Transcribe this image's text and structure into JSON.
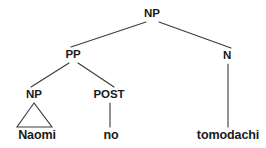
{
  "figure": {
    "kind": "syntax-tree",
    "background_color": "#ffffff",
    "line_color": "#3a3a3a",
    "text_color": "#1a1a1a"
  },
  "nodes": {
    "root_np": {
      "label": "NP",
      "x": 152,
      "y": 14
    },
    "pp": {
      "label": "PP",
      "x": 73,
      "y": 55
    },
    "n": {
      "label": "N",
      "x": 227,
      "y": 56
    },
    "np_inner": {
      "label": "NP",
      "x": 34,
      "y": 95
    },
    "post": {
      "label": "POST",
      "x": 109,
      "y": 95
    }
  },
  "leaves": {
    "naomi": {
      "label": "Naomi",
      "x": 37,
      "y": 135
    },
    "no": {
      "label": "no",
      "x": 111,
      "y": 135
    },
    "tomodachi": {
      "label": "tomodachi",
      "x": 228,
      "y": 135
    }
  },
  "edges": [
    {
      "name": "root-np-to-pp",
      "from": "root_np",
      "to": "pp",
      "x1": 146,
      "y1": 22,
      "x2": 71,
      "y2": 47
    },
    {
      "name": "root-np-to-n",
      "from": "root_np",
      "to": "n",
      "x1": 159,
      "y1": 22,
      "x2": 231,
      "y2": 48
    },
    {
      "name": "pp-to-np",
      "from": "pp",
      "to": "np_inner",
      "x1": 69,
      "y1": 63,
      "x2": 31,
      "y2": 87
    },
    {
      "name": "pp-to-post",
      "from": "pp",
      "to": "post",
      "x1": 78,
      "y1": 63,
      "x2": 114,
      "y2": 87
    },
    {
      "name": "post-to-no",
      "from": "post",
      "to": "no",
      "x1": 110,
      "y1": 103,
      "x2": 110,
      "y2": 127
    },
    {
      "name": "n-to-tomodachi",
      "from": "n",
      "to": "tomodachi",
      "x1": 228,
      "y1": 64,
      "x2": 228,
      "y2": 127
    }
  ],
  "triangle": {
    "name": "np-ellipsis-triangle",
    "apex_x": 34,
    "apex_y": 103,
    "left_x": 17,
    "left_y": 127,
    "right_x": 52,
    "right_y": 127
  }
}
